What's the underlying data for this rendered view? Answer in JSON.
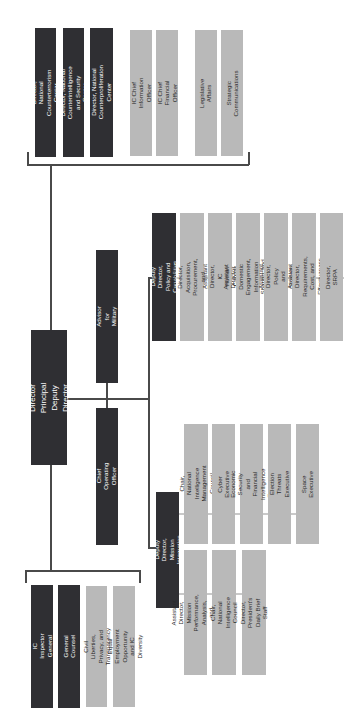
{
  "colors": {
    "dark_box": "#2f2f33",
    "light_box": "#b9b9b9",
    "connector": "#4a4a4a"
  },
  "top_group": {
    "items": [
      {
        "label": "Director, National\nCounterterrorism Center",
        "style": "dark"
      },
      {
        "label": "Director, National Counterintelligence\nand Security Center",
        "style": "dark"
      },
      {
        "label": "Director, National\nCounterproliferation Center",
        "style": "dark"
      },
      {
        "label": "IC Chief Information Officer",
        "style": "light"
      },
      {
        "label": "IC Chief Financial Officer",
        "style": "light"
      },
      {
        "label": "Legislative Affairs",
        "style": "light"
      },
      {
        "label": "Strategic Communications",
        "style": "light"
      }
    ]
  },
  "director": {
    "label": "Director\nPrincipal Deputy Director"
  },
  "advisor_military": {
    "label": "Director's Advisor for Military Affairs"
  },
  "chief_operating_officer": {
    "label": "Chief Operating Officer"
  },
  "policy_capabilities": {
    "head": "Deputy Director,\nPolicy and Capabilities",
    "items": [
      "Assistant Director,\nAcquisition, Procurement, and\nFacilities",
      "Assistant Director,\nIC Human Capital",
      "Assistant Director,\nDomestic Engagement,\nInformation Sharing, and Data",
      "Assistant Director,\nPolicy and Strategy",
      "Assistant Director,\nRequirements, Cost, and Effectiveness",
      "Director,\nSRPA"
    ]
  },
  "mission_integration": {
    "head": "Deputy Director,\nMission Integration",
    "upper_items": [
      "Chair, National Intelligence\nManagement Council",
      "Cyber Executive",
      "Economic Security and Financial\nIntelligence Executive",
      "Election Threats Executive",
      "Space Executive"
    ],
    "lower_items": [
      "Assistant Director,\nMission Performance, Analysis,\nand Collection",
      "Chair, National Intelligence Council",
      "Director,\nPresident's Daily Brief Staff"
    ]
  },
  "bottom_group": {
    "items": [
      {
        "label": "IC Inspector General",
        "style": "dark"
      },
      {
        "label": "General Counsel",
        "style": "dark"
      },
      {
        "label": "Civil Liberties, Privacy, and\nTransparency",
        "style": "light"
      },
      {
        "label": "Equal Employment Opportunity\nand IC Diversity",
        "style": "light"
      }
    ]
  }
}
